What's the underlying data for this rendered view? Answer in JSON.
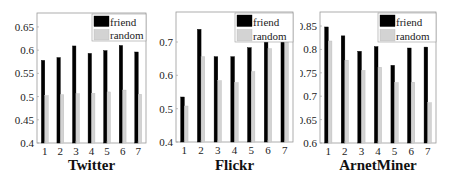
{
  "chart_data": [
    {
      "type": "bar",
      "title": "Twitter",
      "xlabel": "Twitter",
      "ylabel": "",
      "categories": [
        "1",
        "2",
        "3",
        "4",
        "5",
        "6",
        "7"
      ],
      "series": [
        {
          "name": "friend",
          "color": "#000000",
          "values": [
            0.578,
            0.584,
            0.609,
            0.593,
            0.599,
            0.61,
            0.596
          ]
        },
        {
          "name": "random",
          "color": "#d3d3d3",
          "values": [
            0.502,
            0.504,
            0.506,
            0.507,
            0.51,
            0.514,
            0.505
          ]
        }
      ],
      "ylim": [
        0.4,
        0.68
      ],
      "yticks": [
        0.4,
        0.45,
        0.5,
        0.55,
        0.6,
        0.65
      ],
      "ytick_labels": [
        "0.4",
        "0.45",
        "0.5",
        "0.55",
        "0.6",
        "0.65"
      ],
      "legend": {
        "position": "upper right",
        "entries": [
          "friend",
          "random"
        ]
      },
      "grid": false
    },
    {
      "type": "bar",
      "title": "Flickr",
      "xlabel": "Flickr",
      "ylabel": "",
      "categories": [
        "1",
        "2",
        "3",
        "4",
        "5",
        "6",
        "7"
      ],
      "series": [
        {
          "name": "friend",
          "color": "#000000",
          "values": [
            0.535,
            0.738,
            0.656,
            0.656,
            0.683,
            0.7,
            0.7
          ]
        },
        {
          "name": "random",
          "color": "#d3d3d3",
          "values": [
            0.508,
            0.656,
            0.584,
            0.578,
            0.611,
            0.68,
            0.7
          ]
        }
      ],
      "ylim": [
        0.4,
        0.79
      ],
      "yticks": [
        0.4,
        0.5,
        0.6,
        0.7
      ],
      "ytick_labels": [
        "0.4",
        "0.5",
        "0.6",
        "0.7"
      ],
      "legend": {
        "position": "upper right",
        "entries": [
          "friend",
          "random"
        ]
      },
      "grid": false
    },
    {
      "type": "bar",
      "title": "ArnetMiner",
      "xlabel": "ArnetMiner",
      "ylabel": "",
      "categories": [
        "1",
        "2",
        "3",
        "4",
        "5",
        "6",
        "7"
      ],
      "series": [
        {
          "name": "friend",
          "color": "#000000",
          "values": [
            0.848,
            0.829,
            0.796,
            0.806,
            0.766,
            0.803,
            0.805
          ]
        },
        {
          "name": "random",
          "color": "#d3d3d3",
          "values": [
            0.818,
            0.777,
            0.755,
            0.762,
            0.729,
            0.73,
            0.686
          ]
        }
      ],
      "ylim": [
        0.6,
        0.88
      ],
      "yticks": [
        0.6,
        0.65,
        0.7,
        0.75,
        0.8,
        0.85
      ],
      "ytick_labels": [
        "0.6",
        "0.65",
        "0.7",
        "0.75",
        "0.8",
        "0.85"
      ],
      "legend": {
        "position": "upper right",
        "entries": [
          "friend",
          "random"
        ]
      },
      "grid": false
    }
  ]
}
